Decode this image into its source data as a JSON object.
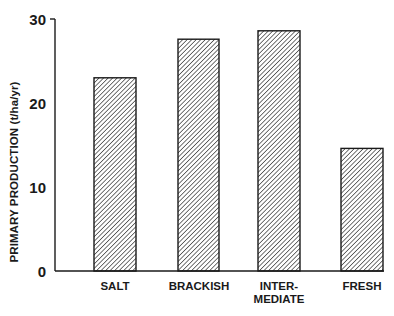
{
  "chart_data": {
    "type": "bar",
    "title": "",
    "xlabel": "",
    "ylabel": "PRIMARY PRODUCTION (t/ha/yr)",
    "categories": [
      "SALT",
      "BRACKISH",
      "INTER-\nMEDIATE",
      "FRESH"
    ],
    "category_lines": [
      [
        "SALT"
      ],
      [
        "BRACKISH"
      ],
      [
        "INTER-",
        "MEDIATE"
      ],
      [
        "FRESH"
      ]
    ],
    "values": [
      23.0,
      27.6,
      28.6,
      14.6
    ],
    "ylim": [
      0,
      30
    ],
    "yticks": [
      0,
      10,
      20,
      30
    ],
    "grid": false,
    "legend": "none",
    "bar_fill": "diagonal-hatch",
    "colors": {
      "ink": "#1a1a1a",
      "background": "#ffffff"
    }
  },
  "axis": {
    "ylabel": "PRIMARY PRODUCTION (t/ha/yr)",
    "ticks": [
      "0",
      "10",
      "20",
      "30"
    ]
  },
  "labels": {
    "salt": "SALT",
    "brackish": "BRACKISH",
    "inter_1": "INTER-",
    "inter_2": "MEDIATE",
    "fresh": "FRESH"
  }
}
